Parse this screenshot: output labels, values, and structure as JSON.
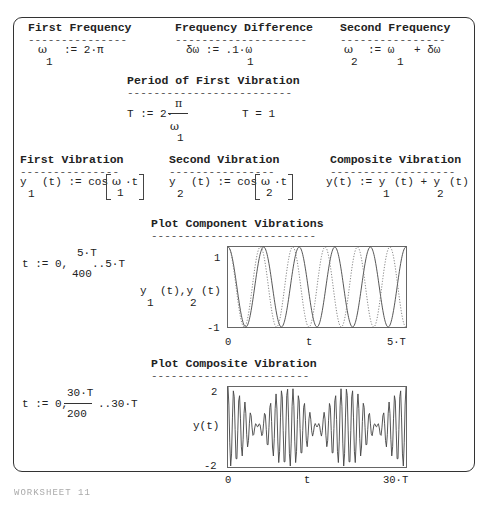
{
  "sections": {
    "first_frequency": {
      "title": "First Frequency",
      "underline": "---------------",
      "lhs_sym": "ω",
      "lhs_sub": "1",
      "rhs": ":= 2·π"
    },
    "frequency_difference": {
      "title": "Frequency Difference",
      "underline": "--------------------",
      "lhs": "δω := .1·ω",
      "rhs_sub": "1"
    },
    "second_frequency": {
      "title": "Second Frequency",
      "underline": "----------------",
      "lhs_sym": "ω",
      "lhs_sub": "2",
      "mid": ":= ω",
      "mid_sub": "1",
      "tail": "+ δω"
    },
    "period": {
      "title": "Period of First Vibration",
      "underline": "-------------------------",
      "lhs": "T := 2·",
      "numerator": "π",
      "denominator_sym": "ω",
      "denominator_sub": "1",
      "result": "T = 1"
    },
    "first_vibration": {
      "title": "First Vibration",
      "underline": "---------------",
      "lhs_sym": "y",
      "lhs_sub": "1",
      "def": "(t) := cos",
      "arg_sym": "ω",
      "arg_sub": "1",
      "arg_tail": "·t"
    },
    "second_vibration": {
      "title": "Second Vibration",
      "underline": "----------------",
      "lhs_sym": "y",
      "lhs_sub": "2",
      "def": "(t) := cos",
      "arg_sym": "ω",
      "arg_sub": "2",
      "arg_tail": "·t"
    },
    "composite_vibration": {
      "title": "Composite Vibration",
      "underline": "-------------------",
      "lhs": "y(t) := y",
      "sub1": "1",
      "mid": "(t) + y",
      "sub2": "2",
      "tail": "(t)"
    },
    "plot_components": {
      "title": "Plot Component Vibrations",
      "underline": "-------------------------",
      "range_lhs": "t := 0,",
      "range_num": "5·T",
      "range_den": "400",
      "range_tail": "..5·T",
      "y_label_a": "y",
      "y_label_sub1": "1",
      "y_label_b": "(t),y",
      "y_label_sub2": "2",
      "y_label_c": "(t)"
    },
    "plot_composite": {
      "title": "Plot Composite Vibration",
      "underline": "------------------------",
      "range_lhs": "t := 0,",
      "range_num": "30·T",
      "range_den": "200",
      "range_tail": "..30·T",
      "y_label": "y(t)"
    }
  },
  "chart_data": [
    {
      "type": "line",
      "title": "Plot Component Vibrations",
      "xlabel": "t",
      "ylabel": "y1(t), y2(t)",
      "x_tick_labels": [
        "0",
        "5·T"
      ],
      "y_tick_labels": [
        "1",
        "-1"
      ],
      "xlim": [
        0,
        5
      ],
      "ylim": [
        -1,
        1
      ],
      "grid": false,
      "series": [
        {
          "name": "y1(t) = cos(ω1·t)",
          "style": "solid",
          "omega": 6.2832
        },
        {
          "name": "y2(t) = cos(ω2·t)",
          "style": "dotted",
          "omega": 6.9115
        }
      ],
      "samples": 400
    },
    {
      "type": "line",
      "title": "Plot Composite Vibration",
      "xlabel": "t",
      "ylabel": "y(t)",
      "x_tick_labels": [
        "0",
        "30·T"
      ],
      "y_tick_labels": [
        "2",
        "-2"
      ],
      "xlim": [
        0,
        30
      ],
      "ylim": [
        -2,
        2
      ],
      "grid": false,
      "series": [
        {
          "name": "y(t) = y1(t) + y2(t)",
          "style": "solid",
          "omega1": 6.2832,
          "omega2": 6.9115
        }
      ],
      "samples": 200
    }
  ],
  "footer": "WORKSHEET 11"
}
